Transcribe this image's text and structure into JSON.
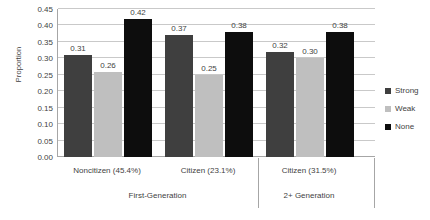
{
  "chart_data": {
    "type": "bar",
    "title": "",
    "xlabel": "",
    "ylabel": "Proportion",
    "ylim": [
      0.0,
      0.45
    ],
    "ytick_step": 0.05,
    "grid": true,
    "legend_position": "right",
    "categories": [
      "Noncitizen (45.4%)",
      "Citizen (23.1%)",
      "Citizen (31.5%)"
    ],
    "supergroups": [
      {
        "label": "First-Generation",
        "categories": [
          "Noncitizen (45.4%)",
          "Citizen (23.1%)"
        ]
      },
      {
        "label": "2+ Generation",
        "categories": [
          "Citizen (31.5%)"
        ]
      }
    ],
    "series": [
      {
        "name": "Strong",
        "color": "#3f3f3f",
        "values": [
          0.31,
          0.37,
          0.32
        ]
      },
      {
        "name": "Weak",
        "color": "#bfbfbf",
        "values": [
          0.26,
          0.25,
          0.3
        ]
      },
      {
        "name": "None",
        "color": "#0d0d0d",
        "values": [
          0.42,
          0.38,
          0.38
        ]
      }
    ],
    "data_labels": [
      [
        "0.31",
        "0.26",
        "0.42"
      ],
      [
        "0.37",
        "0.25",
        "0.38"
      ],
      [
        "0.32",
        "0.30",
        "0.38"
      ]
    ],
    "ytick_labels": [
      "0.45",
      "0.40",
      "0.35",
      "0.30",
      "0.25",
      "0.20",
      "0.15",
      "0.10",
      "0.05",
      "0.00"
    ],
    "ytick_values": [
      0.45,
      0.4,
      0.35,
      0.3,
      0.25,
      0.2,
      0.15,
      0.1,
      0.05,
      0.0
    ]
  },
  "axis": {
    "y_title": "Proportion"
  },
  "legend": {
    "items": [
      {
        "label": "Strong",
        "color": "#3f3f3f"
      },
      {
        "label": "Weak",
        "color": "#bfbfbf"
      },
      {
        "label": "None",
        "color": "#0d0d0d"
      }
    ]
  },
  "colors": {
    "strong": "#3f3f3f",
    "weak": "#bfbfbf",
    "none": "#0d0d0d",
    "gridline": "#c9c9c9",
    "axis": "#a6a6a6",
    "text": "#3f3f3f",
    "background": "#ffffff"
  }
}
